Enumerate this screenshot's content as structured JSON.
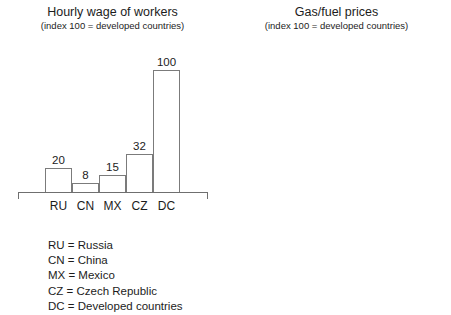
{
  "chart_data": [
    {
      "type": "bar",
      "title": "Hourly wage of workers",
      "subtitle": "(index 100 = developed countries)",
      "xlabel": "",
      "ylabel": "",
      "ylim": [
        0,
        120
      ],
      "grid": false,
      "legend": "none",
      "categories": [
        "RU",
        "CN",
        "MX",
        "CZ",
        "DC"
      ],
      "values": [
        20,
        8,
        15,
        32,
        100
      ],
      "value_labels": [
        "20",
        "8",
        "15",
        "32",
        "100"
      ]
    },
    {
      "type": "bar",
      "title": "Gas/fuel prices",
      "subtitle": "(index 100 = developed countries)",
      "xlabel": "",
      "ylabel": "",
      "ylim": [
        0,
        140
      ],
      "grid": false,
      "legend": "none",
      "categories": [
        "RU",
        "CN",
        "MX",
        "CZ",
        "DC"
      ],
      "values": [
        25,
        75,
        65,
        120,
        100
      ],
      "value_labels": [
        "25",
        "75",
        "65",
        "120",
        "100"
      ]
    }
  ],
  "left_chart": {
    "title": "Hourly wage of workers",
    "subtitle": "(index 100 = developed countries)",
    "bars": [
      {
        "category": "RU",
        "value": 20,
        "label": "20"
      },
      {
        "category": "CN",
        "value": 8,
        "label": "8"
      },
      {
        "category": "MX",
        "value": 15,
        "label": "15"
      },
      {
        "category": "CZ",
        "value": 32,
        "label": "32"
      },
      {
        "category": "DC",
        "value": 100,
        "label": "100"
      }
    ]
  },
  "right_chart": {
    "title": "Gas/fuel prices",
    "subtitle": "(index 100 = developed countries)",
    "bars": [
      {
        "category": "RU",
        "value": 25,
        "label": "25"
      },
      {
        "category": "CN",
        "value": 75,
        "label": "75"
      },
      {
        "category": "MX",
        "value": 65,
        "label": "65"
      },
      {
        "category": "CZ",
        "value": 120,
        "label": "120"
      },
      {
        "category": "DC",
        "value": 100,
        "label": "100"
      }
    ]
  },
  "legend": {
    "rows": [
      "RU = Russia",
      "CN = China",
      "MX = Mexico",
      "CZ = Czech Republic",
      "DC = Developed countries"
    ]
  },
  "colors": {
    "background": "#ffffff",
    "bar_outline": "#7b7b7b",
    "bar_fill": "#ffffff",
    "axis": "#6f6f6f",
    "text": "#1c1c1c"
  }
}
